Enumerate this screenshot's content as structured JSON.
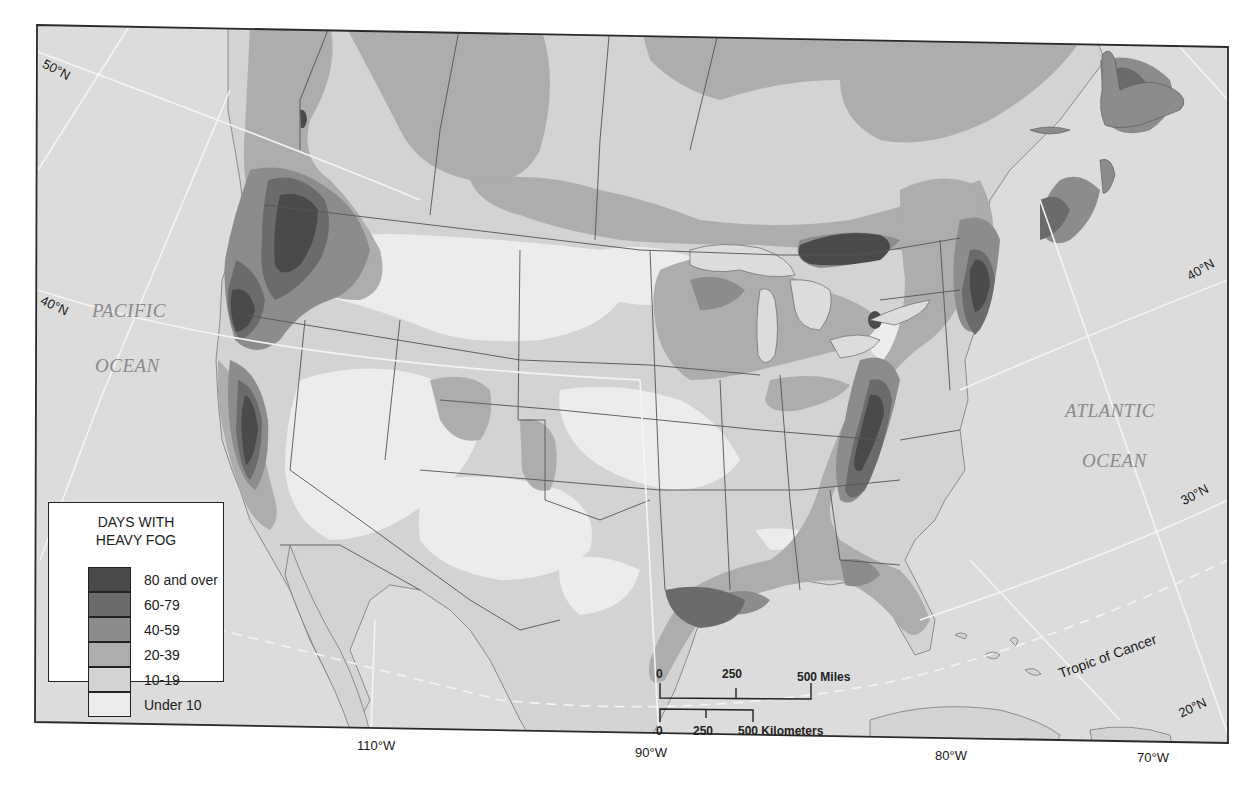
{
  "map": {
    "ocean_labels": {
      "pacific_line1": "PACIFIC",
      "pacific_line2": "OCEAN",
      "atlantic_line1": "ATLANTIC",
      "atlantic_line2": "OCEAN"
    },
    "graticule_labels": {
      "lat_50_west": "50°N",
      "lat_40_west": "40°N",
      "lat_40_east": "40°N",
      "lat_30_east": "30°N",
      "lat_20_east": "20°N",
      "lon_110": "110°W",
      "lon_90": "90°W",
      "lon_80": "80°W",
      "lon_70": "70°W",
      "tropic": "Tropic of Cancer"
    },
    "colors": {
      "water": "#dcdcdc",
      "frame": "#2a2a2a",
      "border": "#555555",
      "graticule": "#f4f4f4"
    }
  },
  "legend": {
    "title_line1": "DAYS WITH",
    "title_line2": "HEAVY FOG",
    "classes": [
      {
        "label": "80 and over",
        "color": "#4a4a4a"
      },
      {
        "label": "60-79",
        "color": "#6b6b6b"
      },
      {
        "label": "40-59",
        "color": "#8c8c8c"
      },
      {
        "label": "20-39",
        "color": "#adadad"
      },
      {
        "label": "10-19",
        "color": "#d3d3d3"
      },
      {
        "label": "Under 10",
        "color": "#ececec"
      }
    ]
  },
  "scale_bar": {
    "miles": {
      "ticks": [
        "0",
        "250",
        "500 Miles"
      ]
    },
    "kilometers": {
      "ticks": [
        "0",
        "250",
        "500 Kilometers"
      ]
    }
  }
}
